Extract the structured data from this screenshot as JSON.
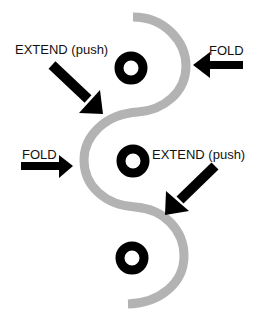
{
  "diagram": {
    "type": "backbone-folding-schematic",
    "colors": {
      "backbone": "#b3b3b3",
      "node": "#000000",
      "arrow": "#000000",
      "background": "#ffffff"
    },
    "labels": {
      "extend_top": "EXTEND (push)",
      "fold_top": "FOLD",
      "fold_middle": "FOLD",
      "extend_middle": "EXTEND (push)"
    },
    "nodes": [
      {
        "id": "node-top",
        "shape": "donut"
      },
      {
        "id": "node-middle",
        "shape": "donut"
      },
      {
        "id": "node-bottom",
        "shape": "donut"
      }
    ],
    "arrows": [
      {
        "id": "arrow-extend-top",
        "direction": "down-right",
        "label": "EXTEND (push)"
      },
      {
        "id": "arrow-fold-top",
        "direction": "left",
        "label": "FOLD"
      },
      {
        "id": "arrow-fold-middle",
        "direction": "right",
        "label": "FOLD"
      },
      {
        "id": "arrow-extend-middle",
        "direction": "down-left",
        "label": "EXTEND (push)"
      }
    ]
  }
}
